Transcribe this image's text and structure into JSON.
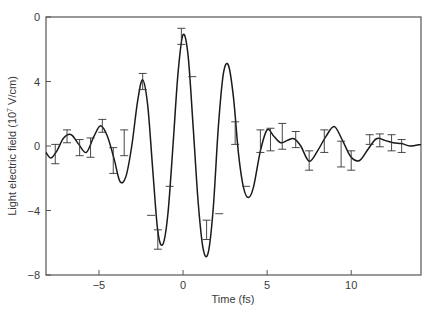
{
  "chart_data": {
    "type": "line",
    "title": "",
    "xlabel": "Time (fs)",
    "ylabel": "Light electric field (10^7 V/cm)",
    "ylabel_main": "Light electric field (10",
    "ylabel_sup": "7",
    "ylabel_tail": " V/cm)",
    "xlim": [
      -8.15,
      14.15
    ],
    "ylim": [
      -8,
      8
    ],
    "xticks": [
      -5,
      0,
      5,
      10
    ],
    "xtick_labels": [
      "−5",
      "0",
      "5",
      "10"
    ],
    "yticks": [
      8,
      4,
      0,
      -4,
      -8
    ],
    "ytick_labels": [
      "0",
      "4",
      "0",
      "−4",
      "−8"
    ],
    "grid": false,
    "legend": null,
    "series": [
      {
        "name": "Light electric field",
        "color": "#1a1a1a",
        "x": [
          -8.15,
          -7.85,
          -7.5,
          -7.1,
          -6.65,
          -6.2,
          -5.75,
          -5.3,
          -4.9,
          -4.5,
          -4.1,
          -3.75,
          -3.4,
          -3.05,
          -2.7,
          -2.4,
          -2.1,
          -1.8,
          -1.5,
          -1.2,
          -0.9,
          -0.6,
          -0.3,
          0.0,
          0.3,
          0.6,
          0.9,
          1.2,
          1.5,
          1.8,
          2.1,
          2.4,
          2.7,
          3.0,
          3.3,
          3.6,
          3.9,
          4.2,
          4.6,
          5.0,
          5.4,
          5.8,
          6.2,
          6.6,
          7.0,
          7.5,
          8.0,
          8.5,
          9.0,
          9.5,
          10.0,
          10.5,
          11.0,
          11.5,
          12.0,
          12.5,
          13.0,
          13.5,
          14.15
        ],
        "y": [
          -0.4,
          -0.75,
          -0.3,
          0.5,
          0.7,
          0.1,
          -0.4,
          0.6,
          1.25,
          0.6,
          -0.8,
          -2.2,
          -1.9,
          0.0,
          2.8,
          4.1,
          2.5,
          -1.5,
          -5.3,
          -6.1,
          -4.2,
          0.0,
          4.5,
          6.9,
          5.6,
          1.2,
          -3.5,
          -6.4,
          -6.6,
          -3.8,
          1.2,
          4.5,
          5.0,
          3.0,
          -0.5,
          -2.6,
          -3.2,
          -2.5,
          -0.3,
          1.0,
          0.6,
          0.2,
          0.35,
          0.45,
          0.0,
          -0.95,
          -0.3,
          0.6,
          1.2,
          0.3,
          -0.7,
          -0.9,
          -0.2,
          0.45,
          0.35,
          0.2,
          0.15,
          0.0,
          0.1
        ]
      }
    ],
    "error_bars": {
      "x": [
        -7.6,
        -6.9,
        -6.15,
        -5.5,
        -4.8,
        -4.15,
        -3.5,
        -2.4,
        -1.9,
        -1.5,
        -0.8,
        -0.1,
        0.55,
        1.4,
        2.15,
        3.1,
        3.75,
        4.6,
        5.2,
        5.9,
        6.7,
        7.5,
        8.4,
        9.4,
        10.0,
        11.1,
        11.7,
        12.4,
        13.0
      ],
      "y": [
        -0.5,
        0.6,
        -0.1,
        -0.1,
        1.25,
        -0.9,
        0.2,
        4.0,
        -4.3,
        -5.8,
        -2.5,
        6.8,
        4.3,
        -5.2,
        -4.2,
        0.8,
        -2.5,
        0.3,
        0.4,
        0.6,
        0.4,
        -0.9,
        0.3,
        -0.5,
        -0.9,
        0.4,
        0.35,
        0.2,
        0.0
      ],
      "err": [
        0.6,
        0.4,
        0.5,
        0.6,
        0.4,
        0.8,
        0.8,
        0.5,
        0.0,
        0.6,
        0.0,
        0.5,
        0.0,
        0.6,
        0.0,
        0.7,
        0.0,
        0.7,
        0.7,
        0.8,
        0.5,
        0.6,
        0.7,
        0.8,
        0.6,
        0.3,
        0.4,
        0.5,
        0.4
      ]
    }
  }
}
